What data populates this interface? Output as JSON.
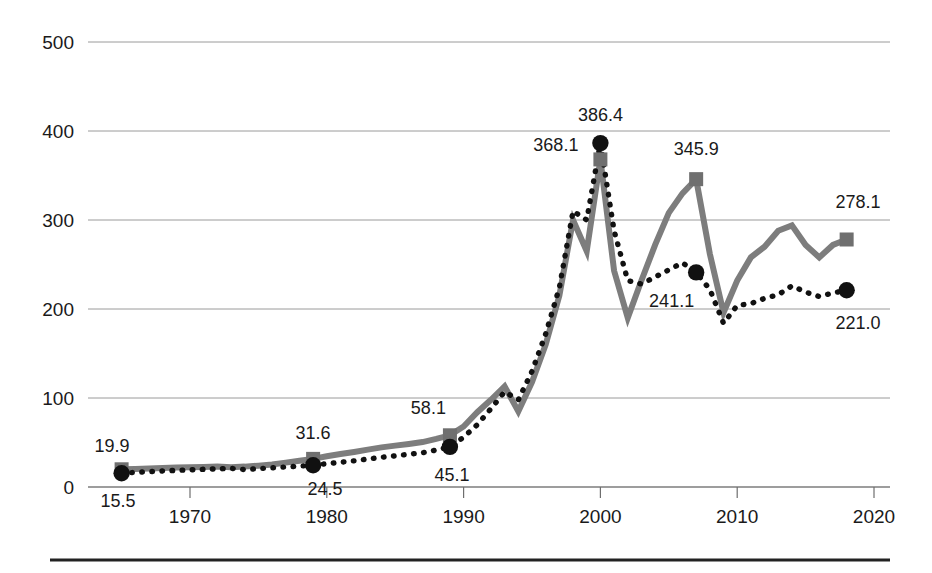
{
  "chart_data": {
    "type": "line",
    "title": "",
    "subtitle": "",
    "xlabel": "",
    "ylabel": "",
    "xlim": [
      1964,
      2021
    ],
    "ylim": [
      0,
      500
    ],
    "grid": true,
    "legend_position": "none",
    "x_ticks": [
      "1970",
      "1980",
      "1990",
      "2000",
      "2010",
      "2020"
    ],
    "x_tick_values": [
      1970,
      1980,
      1990,
      2000,
      2010,
      2020
    ],
    "y_ticks": [
      "0",
      "100",
      "200",
      "300",
      "400",
      "500"
    ],
    "y_tick_values": [
      0,
      100,
      200,
      300,
      400,
      500
    ],
    "x": [
      1965,
      1966,
      1967,
      1968,
      1969,
      1970,
      1971,
      1972,
      1973,
      1974,
      1975,
      1976,
      1977,
      1978,
      1979,
      1980,
      1981,
      1982,
      1983,
      1984,
      1985,
      1986,
      1987,
      1988,
      1989,
      1990,
      1991,
      1992,
      1993,
      1994,
      1995,
      1996,
      1997,
      1998,
      1999,
      2000,
      2001,
      2002,
      2003,
      2004,
      2005,
      2006,
      2007,
      2008,
      2009,
      2010,
      2011,
      2012,
      2013,
      2014,
      2015,
      2016,
      2017,
      2018
    ],
    "series": [
      {
        "name": "solid-series",
        "style": "solid",
        "marker": "square",
        "color": "#7d7d7d",
        "values": [
          19.9,
          20.3,
          20.8,
          21.3,
          21.8,
          22.2,
          22.6,
          23.0,
          22.2,
          22.9,
          24.0,
          25.2,
          27.4,
          29.5,
          31.6,
          34.5,
          37.0,
          39.4,
          42.0,
          44.5,
          46.5,
          48.4,
          50.5,
          54.0,
          58.1,
          68.0,
          84.0,
          98.0,
          113.0,
          85.0,
          118.0,
          160.0,
          215.0,
          300.0,
          265.0,
          368.1,
          243.0,
          190.0,
          232.0,
          272.0,
          308.0,
          330.0,
          345.9,
          262.0,
          196.0,
          232.0,
          258.0,
          270.0,
          288.0,
          294.0,
          272.0,
          258.0,
          272.0,
          278.1
        ]
      },
      {
        "name": "dotted-series",
        "style": "dotted",
        "marker": "circle",
        "color": "#111111",
        "values": [
          15.5,
          16.4,
          17.2,
          18.0,
          18.7,
          19.3,
          19.9,
          20.4,
          20.9,
          19.6,
          20.6,
          21.5,
          22.5,
          23.4,
          24.5,
          26.2,
          27.8,
          29.4,
          31.4,
          33.4,
          35.0,
          36.8,
          38.5,
          41.5,
          45.1,
          56.0,
          70.0,
          88.0,
          107.0,
          98.0,
          130.0,
          172.0,
          224.0,
          310.0,
          300.0,
          386.4,
          288.0,
          232.0,
          228.0,
          236.0,
          244.0,
          252.0,
          241.1,
          222.0,
          184.0,
          204.0,
          206.0,
          212.0,
          216.0,
          226.0,
          219.0,
          214.0,
          218.0,
          221.0
        ]
      }
    ],
    "annotations": [
      {
        "text": "19.9",
        "x": 1965,
        "y": 19.9,
        "series": "solid-series",
        "placement": "above-left"
      },
      {
        "text": "15.5",
        "x": 1965,
        "y": 15.5,
        "series": "dotted-series",
        "placement": "below-left"
      },
      {
        "text": "31.6",
        "x": 1979,
        "y": 31.6,
        "series": "solid-series",
        "placement": "above"
      },
      {
        "text": "24.5",
        "x": 1979,
        "y": 24.5,
        "series": "dotted-series",
        "placement": "below"
      },
      {
        "text": "58.1",
        "x": 1989,
        "y": 58.1,
        "series": "solid-series",
        "placement": "above-left"
      },
      {
        "text": "45.1",
        "x": 1989,
        "y": 45.1,
        "series": "dotted-series",
        "placement": "below"
      },
      {
        "text": "368.1",
        "x": 2000,
        "y": 368.1,
        "series": "solid-series",
        "placement": "left"
      },
      {
        "text": "386.4",
        "x": 2000,
        "y": 386.4,
        "series": "dotted-series",
        "placement": "above"
      },
      {
        "text": "345.9",
        "x": 2007,
        "y": 345.9,
        "series": "solid-series",
        "placement": "above"
      },
      {
        "text": "241.1",
        "x": 2007,
        "y": 241.1,
        "series": "dotted-series",
        "placement": "below-left"
      },
      {
        "text": "278.1",
        "x": 2018,
        "y": 278.1,
        "series": "solid-series",
        "placement": "above-left"
      },
      {
        "text": "221.0",
        "x": 2018,
        "y": 221.0,
        "series": "dotted-series",
        "placement": "below-left"
      }
    ],
    "colors": {
      "solid_series": "#7d7d7d",
      "dotted_series": "#111111",
      "gridline": "#9a9a9a",
      "text": "#1a1a1a",
      "background": "#ffffff",
      "bottom_rule": "#222222"
    }
  }
}
